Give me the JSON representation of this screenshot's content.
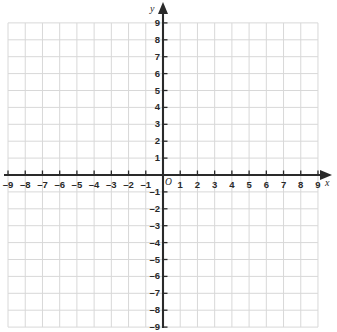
{
  "chart_data": {
    "type": "scatter",
    "title": "",
    "subtitle": "",
    "xlabel": "x",
    "ylabel": "y",
    "xlim": [
      -9,
      9
    ],
    "ylim": [
      -9,
      9
    ],
    "grid": true,
    "gridline_step": 1,
    "legend": null,
    "legend_position": "none",
    "series": [],
    "x": [],
    "values": [],
    "annotations": [
      "O"
    ],
    "xticks": [
      -9,
      -8,
      -7,
      -6,
      -5,
      -4,
      -3,
      -2,
      -1,
      1,
      2,
      3,
      4,
      5,
      6,
      7,
      8,
      9
    ],
    "yticks": [
      -9,
      -8,
      -7,
      -6,
      -5,
      -4,
      -3,
      -2,
      -1,
      1,
      2,
      3,
      4,
      5,
      6,
      7,
      8,
      9
    ],
    "xtick_labels": [
      "–9",
      "–8",
      "–7",
      "–6",
      "–5",
      "–4",
      "–3",
      "–2",
      "–1",
      "1",
      "2",
      "3",
      "4",
      "5",
      "6",
      "7",
      "8",
      "9"
    ],
    "ytick_labels": [
      "–9",
      "–8",
      "–7",
      "–6",
      "–5",
      "–4",
      "–3",
      "–2",
      "–1",
      "1",
      "2",
      "3",
      "4",
      "5",
      "6",
      "7",
      "8",
      "9"
    ]
  },
  "axes": {
    "origin_label": "O",
    "x_axis_label": "x",
    "y_axis_label": "y",
    "x_arrow": "arrow-right",
    "y_arrow": "arrow-up"
  },
  "colors": {
    "background": "#ffffff",
    "gridline": "#d8d8d8",
    "axis": "#2a2a2a",
    "tick_label": "#2a2a2a"
  }
}
